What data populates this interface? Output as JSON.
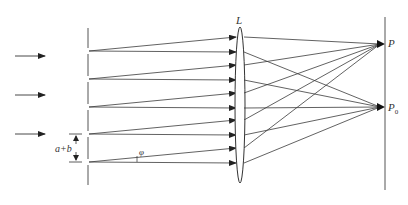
{
  "figure": {
    "type": "diffraction-grating-diagram"
  },
  "labels": {
    "lens": "L",
    "point_p": "P",
    "point_p0_main": "P",
    "point_p0_sub": "0",
    "grating_constant": "a+b",
    "angle": "φ"
  },
  "colors": {
    "line": "#3a3a3a",
    "background": "#ffffff"
  },
  "geometry": {
    "incident_arrows_y": [
      56,
      95,
      134
    ],
    "slits_y": [
      51,
      79,
      107,
      134,
      162
    ],
    "lens_hits_horizontal_y": [
      52,
      80,
      108,
      135,
      163
    ],
    "lens_hits_angled_y": [
      37,
      65,
      93,
      120,
      148
    ],
    "grating_x": 88,
    "lens_x": 240,
    "screen_x": 385,
    "focus_p_y": 44,
    "focus_p0_y": 107
  }
}
